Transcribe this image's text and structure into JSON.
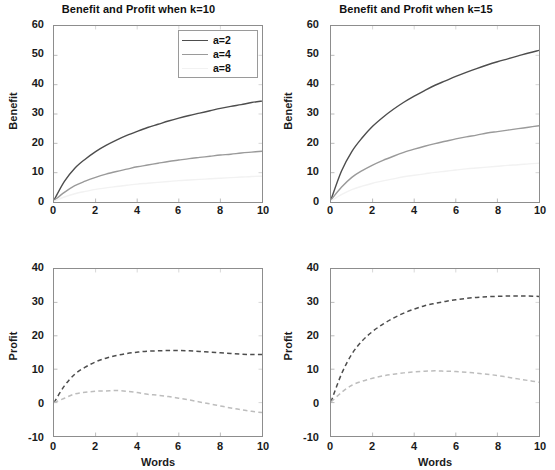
{
  "figure": {
    "width": 555,
    "height": 470
  },
  "legend": {
    "position": "top-right of upper-left panel",
    "entries": [
      {
        "label": "a=2",
        "color": "#4d4d4d"
      },
      {
        "label": "a=4",
        "color": "#9a9a9a"
      },
      {
        "label": "a=8",
        "color": "#f2f2f2"
      }
    ]
  },
  "chart_data": [
    {
      "type": "line",
      "panel": "top-left",
      "title": "Benefit and Profit when k=10",
      "xlabel": "",
      "ylabel": "Benefit",
      "xlim": [
        0,
        10
      ],
      "ylim": [
        0,
        60
      ],
      "xticks": [
        0,
        2,
        4,
        6,
        8,
        10
      ],
      "yticks": [
        0,
        10,
        20,
        30,
        40,
        50,
        60
      ],
      "grid": false,
      "linestyle": "solid",
      "x": [
        0,
        0.5,
        1,
        1.5,
        2,
        2.5,
        3,
        3.5,
        4,
        4.5,
        5,
        5.5,
        6,
        6.5,
        7,
        7.5,
        8,
        8.5,
        9,
        9.5,
        10
      ],
      "series": [
        {
          "name": "a=2",
          "color": "#4d4d4d",
          "values": [
            0.6,
            7.0,
            11.5,
            14.6,
            17.2,
            19.3,
            21.1,
            22.7,
            24.1,
            25.4,
            26.5,
            27.6,
            28.6,
            29.5,
            30.3,
            31.1,
            31.9,
            32.6,
            33.2,
            33.9,
            34.4
          ]
        },
        {
          "name": "a=4",
          "color": "#9a9a9a",
          "values": [
            0.5,
            3.3,
            5.6,
            7.1,
            8.4,
            9.5,
            10.4,
            11.2,
            12.0,
            12.6,
            13.2,
            13.8,
            14.3,
            14.8,
            15.2,
            15.6,
            16.0,
            16.3,
            16.7,
            17.0,
            17.3
          ]
        },
        {
          "name": "a=8",
          "color": "#f2f2f2",
          "values": [
            0.3,
            1.7,
            2.8,
            3.6,
            4.3,
            4.8,
            5.3,
            5.7,
            6.1,
            6.4,
            6.7,
            7.0,
            7.3,
            7.5,
            7.7,
            7.9,
            8.1,
            8.3,
            8.5,
            8.7,
            8.8
          ]
        }
      ]
    },
    {
      "type": "line",
      "panel": "top-right",
      "title": "Benefit and Profit when k=15",
      "xlabel": "",
      "ylabel": "Benefit",
      "xlim": [
        0,
        10
      ],
      "ylim": [
        0,
        60
      ],
      "xticks": [
        0,
        2,
        4,
        6,
        8,
        10
      ],
      "yticks": [
        0,
        10,
        20,
        30,
        40,
        50,
        60
      ],
      "grid": false,
      "linestyle": "solid",
      "x": [
        0,
        0.5,
        1,
        1.5,
        2,
        2.5,
        3,
        3.5,
        4,
        4.5,
        5,
        5.5,
        6,
        6.5,
        7,
        7.5,
        8,
        8.5,
        9,
        9.5,
        10
      ],
      "series": [
        {
          "name": "a=2",
          "color": "#4d4d4d",
          "values": [
            0.8,
            10.5,
            17.2,
            21.9,
            25.8,
            28.9,
            31.6,
            34.0,
            36.1,
            38.0,
            39.8,
            41.3,
            42.8,
            44.2,
            45.5,
            46.7,
            47.8,
            48.8,
            49.8,
            50.8,
            51.7
          ]
        },
        {
          "name": "a=4",
          "color": "#9a9a9a",
          "values": [
            0.7,
            5.0,
            8.4,
            10.7,
            12.6,
            14.2,
            15.6,
            16.9,
            18.0,
            19.0,
            19.9,
            20.7,
            21.5,
            22.2,
            22.8,
            23.5,
            24.0,
            24.5,
            25.0,
            25.5,
            26.0
          ]
        },
        {
          "name": "a=8",
          "color": "#f2f2f2",
          "values": [
            0.4,
            2.5,
            4.2,
            5.4,
            6.4,
            7.2,
            7.9,
            8.6,
            9.1,
            9.6,
            10.1,
            10.5,
            10.9,
            11.3,
            11.6,
            11.9,
            12.2,
            12.5,
            12.7,
            13.0,
            13.2
          ]
        }
      ]
    },
    {
      "type": "line",
      "panel": "bottom-left",
      "title": "",
      "xlabel": "Words",
      "ylabel": "Profit",
      "xlim": [
        0,
        10
      ],
      "ylim": [
        -10,
        40
      ],
      "xticks": [
        0,
        2,
        4,
        6,
        8,
        10
      ],
      "yticks": [
        -10,
        0,
        10,
        20,
        30,
        40
      ],
      "grid": false,
      "linestyle": "dashed",
      "x": [
        0,
        0.5,
        1,
        1.5,
        2,
        2.5,
        3,
        3.5,
        4,
        4.5,
        5,
        5.5,
        6,
        6.5,
        7,
        7.5,
        8,
        8.5,
        9,
        9.5,
        10
      ],
      "series": [
        {
          "name": "a=2",
          "color": "#4d4d4d",
          "values": [
            0.0,
            5.0,
            8.5,
            10.6,
            12.2,
            13.3,
            14.1,
            14.7,
            15.1,
            15.4,
            15.5,
            15.6,
            15.6,
            15.5,
            15.3,
            15.1,
            14.9,
            14.7,
            14.5,
            14.4,
            14.4
          ]
        },
        {
          "name": "a=4",
          "color": "#bdbdbd",
          "values": [
            0.0,
            1.3,
            2.6,
            3.1,
            3.4,
            3.5,
            3.6,
            3.4,
            3.0,
            2.5,
            2.2,
            1.8,
            1.3,
            0.8,
            0.2,
            -0.4,
            -1.0,
            -1.6,
            -2.1,
            -2.6,
            -3.0
          ]
        }
      ]
    },
    {
      "type": "line",
      "panel": "bottom-right",
      "title": "",
      "xlabel": "Words",
      "ylabel": "Profit",
      "xlim": [
        0,
        10
      ],
      "ylim": [
        -10,
        40
      ],
      "xticks": [
        0,
        2,
        4,
        6,
        8,
        10
      ],
      "yticks": [
        -10,
        0,
        10,
        20,
        30,
        40
      ],
      "grid": false,
      "linestyle": "dashed",
      "x": [
        0,
        0.5,
        1,
        1.5,
        2,
        2.5,
        3,
        3.5,
        4,
        4.5,
        5,
        5.5,
        6,
        6.5,
        7,
        7.5,
        8,
        8.5,
        9,
        9.5,
        10
      ],
      "series": [
        {
          "name": "a=2",
          "color": "#4d4d4d",
          "values": [
            0.2,
            8.5,
            14.5,
            18.5,
            21.3,
            23.5,
            25.3,
            26.8,
            28.0,
            29.0,
            29.7,
            30.3,
            30.8,
            31.2,
            31.5,
            31.7,
            31.8,
            31.9,
            31.9,
            31.9,
            31.8
          ]
        },
        {
          "name": "a=4",
          "color": "#bdbdbd",
          "values": [
            0.2,
            3.0,
            5.2,
            6.4,
            7.3,
            8.0,
            8.5,
            8.9,
            9.2,
            9.4,
            9.5,
            9.4,
            9.3,
            9.1,
            8.8,
            8.5,
            8.1,
            7.6,
            7.1,
            6.6,
            6.1
          ]
        }
      ]
    }
  ]
}
